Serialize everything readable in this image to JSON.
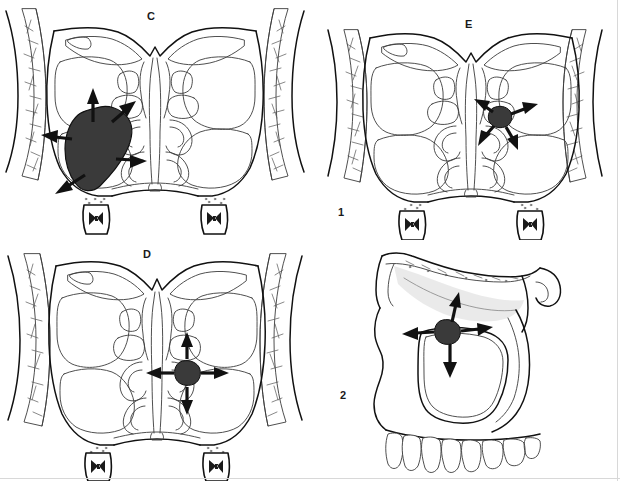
{
  "figure": {
    "type": "medical-illustration",
    "background_color": "#ffffff",
    "line_color": "#111111",
    "mass_fill_color": "#3a3a3a",
    "width": 620,
    "height": 481
  },
  "panels": [
    {
      "id": "panel-c",
      "label": "C",
      "label_x": 150,
      "label_y": 17,
      "view": "coronal section through paranasal sinuses",
      "mass": {
        "location": "left maxillary sinus",
        "size": "large",
        "fill": "#3a3a3a",
        "arrow_count": 5,
        "arrow_directions": [
          "superior",
          "superomedial",
          "lateral",
          "medial",
          "inferolateral"
        ]
      }
    },
    {
      "id": "panel-e",
      "label": "E",
      "label_x": 468,
      "label_y": 25,
      "view": "coronal section through paranasal sinuses",
      "mass": {
        "location": "right ethmoid / middle meatus region",
        "size": "small",
        "fill": "#3a3a3a",
        "arrow_count": 4,
        "arrow_directions": [
          "superomedial",
          "superolateral",
          "inferomedial",
          "inferolateral"
        ]
      }
    },
    {
      "id": "panel-d",
      "label": "D",
      "label_x": 146,
      "label_y": 255,
      "view": "coronal section through paranasal sinuses",
      "mass": {
        "location": "right middle meatus / ostiomeatal complex",
        "size": "small",
        "fill": "#3a3a3a",
        "arrow_count": 4,
        "arrow_directions": [
          "superior",
          "inferior",
          "medial",
          "lateral"
        ]
      }
    },
    {
      "id": "panel-lateral",
      "label": "",
      "view": "lateral view of maxilla, orbit and upper dental arch",
      "mass": {
        "location": "maxillary sinus region below orbital floor",
        "size": "small",
        "fill": "#3a3a3a",
        "arrow_count": 4,
        "arrow_directions": [
          "superior",
          "inferior",
          "anterior",
          "posterior"
        ]
      }
    }
  ],
  "row_labels": [
    {
      "id": "row-label-1",
      "text": "1",
      "x": 340,
      "y": 211
    },
    {
      "id": "row-label-2",
      "text": "2",
      "x": 342,
      "y": 393
    }
  ]
}
